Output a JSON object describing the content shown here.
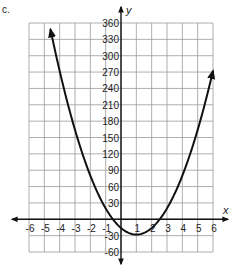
{
  "part_label": "c.",
  "chart_data": {
    "type": "line",
    "title": "",
    "xlabel": "x",
    "ylabel": "y",
    "xlim": [
      -6,
      6
    ],
    "ylim": [
      -60,
      360
    ],
    "x_ticks": [
      -6,
      -5,
      -4,
      -3,
      -2,
      -1,
      1,
      2,
      3,
      4,
      5,
      6
    ],
    "y_ticks": [
      360,
      330,
      300,
      270,
      240,
      210,
      180,
      150,
      120,
      90,
      60,
      30,
      -30,
      -60
    ],
    "x_tick_labels": [
      "-6",
      "-5",
      "-4",
      "-3",
      "-2",
      "-1",
      "1",
      "2",
      "3",
      "4",
      "5",
      "6"
    ],
    "y_tick_labels": [
      "360",
      "330",
      "300",
      "270",
      "240",
      "210",
      "180",
      "150",
      "120",
      "90",
      "60",
      "30",
      "-30",
      "-60"
    ],
    "grid": true,
    "series": [
      {
        "name": "parabola",
        "equation": "y = 12x^2 - 24x - 16",
        "vertex": [
          1,
          -28
        ],
        "x_intercepts": [
          -0.58,
          2.58
        ],
        "y_intercept": -16,
        "x_range": [
          -4.6,
          6
        ],
        "arrows": "both ends",
        "color": "#111111"
      }
    ]
  }
}
